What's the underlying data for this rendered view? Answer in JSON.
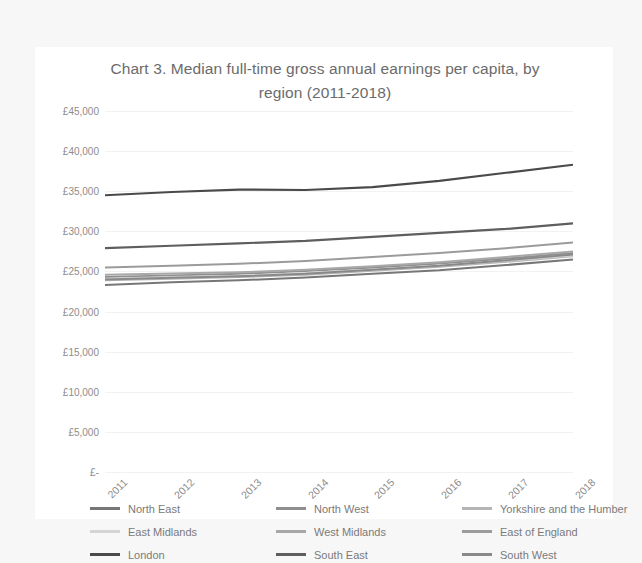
{
  "chart_data": {
    "type": "line",
    "title": "Chart 3. Median full-time gross annual earnings per capita, by region (2011-2018)",
    "title_line1": "Chart 3. Median full-time gross annual earnings per capita, by",
    "title_line2": "region (2011-2018)",
    "xlabel": "",
    "ylabel": "",
    "x": [
      "2011",
      "2012",
      "2013",
      "2014",
      "2015",
      "2016",
      "2017",
      "2018"
    ],
    "categories": [
      "2011",
      "2012",
      "2013",
      "2014",
      "2015",
      "2016",
      "2017",
      "2018"
    ],
    "ylim": [
      0,
      45000
    ],
    "ytick_values": [
      45000,
      40000,
      35000,
      30000,
      25000,
      20000,
      15000,
      10000,
      5000,
      0
    ],
    "ytick_labels": [
      "£45,000",
      "£40,000",
      "£35,000",
      "£30,000",
      "£25,000",
      "£20,000",
      "£15,000",
      "£10,000",
      "£5,000",
      "£-"
    ],
    "grid": true,
    "legend_position": "bottom",
    "series": [
      {
        "name": "North East",
        "color": "#777777",
        "width": 2.0,
        "values": [
          23300,
          23650,
          23900,
          24250,
          24700,
          25150,
          25800,
          26500
        ]
      },
      {
        "name": "North West",
        "color": "#8f8f8f",
        "width": 2.0,
        "values": [
          24300,
          24500,
          24700,
          25050,
          25500,
          26000,
          26600,
          27300
        ]
      },
      {
        "name": "Yorkshire and the Humber",
        "color": "#b5b5b5",
        "width": 2.0,
        "values": [
          23900,
          24100,
          24300,
          24600,
          25100,
          25600,
          26200,
          26900
        ]
      },
      {
        "name": "East Midlands",
        "color": "#d4d4d4",
        "width": 2.0,
        "values": [
          24100,
          24300,
          24450,
          24800,
          25200,
          25700,
          26350,
          27000
        ]
      },
      {
        "name": "West Midlands",
        "color": "#a8a8a8",
        "width": 2.0,
        "values": [
          24600,
          24750,
          24900,
          25200,
          25650,
          26150,
          26800,
          27500
        ]
      },
      {
        "name": "East of England",
        "color": "#9b9b9b",
        "width": 2.0,
        "values": [
          25500,
          25700,
          25950,
          26300,
          26800,
          27300,
          27900,
          28600
        ]
      },
      {
        "name": "London",
        "color": "#4a4a4a",
        "width": 2.2,
        "values": [
          34500,
          34900,
          35200,
          35150,
          35500,
          36300,
          37300,
          38300
        ]
      },
      {
        "name": "South East",
        "color": "#5e5e5e",
        "width": 2.2,
        "values": [
          27900,
          28200,
          28500,
          28800,
          29300,
          29800,
          30300,
          31000
        ]
      },
      {
        "name": "South West",
        "color": "#898989",
        "width": 2.0,
        "values": [
          24000,
          24200,
          24400,
          24700,
          25200,
          25700,
          26400,
          27100
        ]
      }
    ]
  },
  "legend": {
    "rows": [
      [
        {
          "label": "North East",
          "color": "#777777"
        },
        {
          "label": "North West",
          "color": "#8f8f8f"
        },
        {
          "label": "Yorkshire and the Humber",
          "color": "#b5b5b5"
        }
      ],
      [
        {
          "label": "East Midlands",
          "color": "#d4d4d4"
        },
        {
          "label": "West Midlands",
          "color": "#a8a8a8"
        },
        {
          "label": "East of England",
          "color": "#9b9b9b"
        }
      ],
      [
        {
          "label": "London",
          "color": "#4a4a4a"
        },
        {
          "label": "South East",
          "color": "#5e5e5e"
        },
        {
          "label": "South West",
          "color": "#898989"
        }
      ]
    ]
  }
}
